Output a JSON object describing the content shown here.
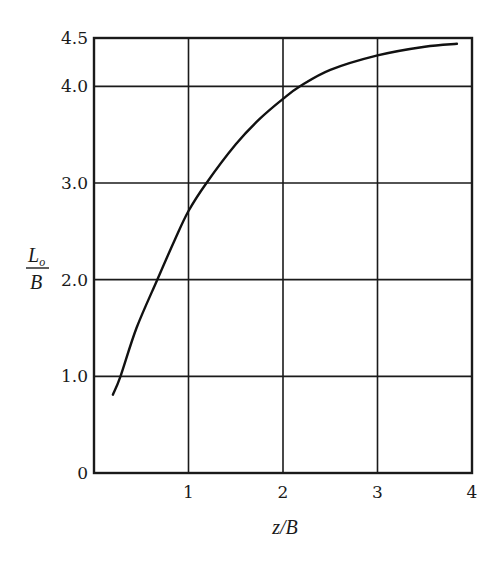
{
  "chart_data": {
    "type": "line",
    "title": "",
    "xlabel": "z/B",
    "ylabel": {
      "numerator": "L",
      "subscript": "o",
      "denominator": "B"
    },
    "xlim": [
      0,
      4
    ],
    "ylim": [
      0,
      4.5
    ],
    "grid": true,
    "xticks": [
      1,
      2,
      3,
      4
    ],
    "xtick_labels": [
      "1",
      "2",
      "3",
      "4"
    ],
    "yticks": [
      0,
      1.0,
      2.0,
      3.0,
      4.0,
      4.5
    ],
    "ytick_labels": [
      "0",
      "1.0",
      "2.0",
      "3.0",
      "4.0",
      "4.5"
    ],
    "series": [
      {
        "name": "L_o/B",
        "x": [
          0.2,
          0.28,
          0.45,
          0.67,
          0.85,
          1.0,
          1.19,
          1.5,
          1.75,
          2.0,
          2.18,
          2.5,
          3.0,
          3.5,
          3.84
        ],
        "y": [
          0.81,
          1.0,
          1.5,
          2.0,
          2.4,
          2.71,
          3.0,
          3.4,
          3.66,
          3.87,
          4.0,
          4.17,
          4.32,
          4.41,
          4.44
        ]
      }
    ]
  }
}
